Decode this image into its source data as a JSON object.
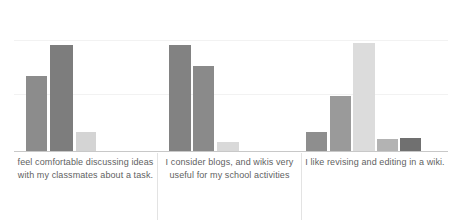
{
  "chart_data": {
    "type": "bar",
    "title": "",
    "subtitle": "",
    "xlabel": "",
    "ylabel": "",
    "grid": true,
    "legend": "none",
    "ylim": [
      0,
      100
    ],
    "categories": [
      "feel comfortable discussing ideas with my classmates about a task.",
      "I consider blogs, and wikis very useful for my school activities",
      "I like revising and editing in a wiki."
    ],
    "groups": [
      {
        "category": "feel comfortable discussing ideas with my classmates about a task.",
        "bars": [
          {
            "value": 50,
            "color": "#8c8c8c"
          },
          {
            "value": 71,
            "color": "#7d7d7d"
          },
          {
            "value": 13,
            "color": "#d4d4d4"
          }
        ]
      },
      {
        "category": "I consider blogs, and wikis very useful for my school activities",
        "bars": [
          {
            "value": 71,
            "color": "#828282"
          },
          {
            "value": 57,
            "color": "#8a8a8a"
          },
          {
            "value": 6,
            "color": "#d9d9d9"
          }
        ]
      },
      {
        "category": "I like revising and editing in a wiki.",
        "bars": [
          {
            "value": 13,
            "color": "#8e8e8e"
          },
          {
            "value": 37,
            "color": "#9a9a9a"
          },
          {
            "value": 72,
            "color": "#dcdcdc"
          },
          {
            "value": 8,
            "color": "#b3b3b3"
          },
          {
            "value": 9,
            "color": "#707070"
          }
        ]
      }
    ],
    "gridline_values": [
      73,
      38
    ],
    "axis_color": "#c8c8c8",
    "grid_color": "#f2f2f2",
    "label_color": "#5f5f5f",
    "background": "#ffffff"
  },
  "layout": {
    "group_spans": [
      {
        "left": 14,
        "width": 143
      },
      {
        "left": 158,
        "width": 143
      },
      {
        "left": 302,
        "width": 146
      }
    ],
    "bar_geometry": [
      [
        {
          "x": 26,
          "w": 21
        },
        {
          "x": 50,
          "w": 23
        },
        {
          "x": 76,
          "w": 20
        }
      ],
      [
        {
          "x": 169,
          "w": 22
        },
        {
          "x": 193,
          "w": 21
        },
        {
          "x": 217,
          "w": 22
        }
      ],
      [
        {
          "x": 306,
          "w": 21
        },
        {
          "x": 330,
          "w": 21
        },
        {
          "x": 353,
          "w": 22
        },
        {
          "x": 377,
          "w": 21
        },
        {
          "x": 400,
          "w": 21
        }
      ]
    ],
    "separators": [
      157,
      301
    ]
  }
}
